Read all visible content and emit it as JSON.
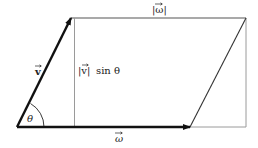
{
  "diagram": {
    "labels": {
      "v_vector": "v",
      "omega_vector": "ω",
      "omega_magnitude": "|ω|",
      "height": "|v| sin θ",
      "height_magnitude": "|v|",
      "height_sin": "sin θ",
      "angle": "θ"
    },
    "colors": {
      "vector": "#111111",
      "outline": "#9a9a9a",
      "diagonal": "#333333",
      "background": "#ffffff"
    }
  }
}
